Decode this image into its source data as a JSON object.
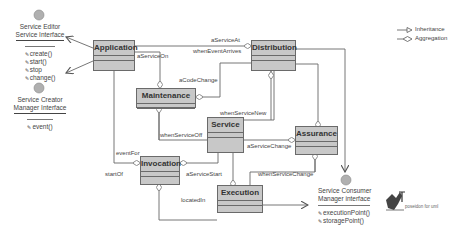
{
  "classes": {
    "application": "Application",
    "distribution": "Distribution",
    "maintenance": "Maintenance",
    "service": "Service",
    "assurance": "Assurance",
    "invocation": "Invocation",
    "execution": "Execution"
  },
  "relations": {
    "aServiceOn": "aServiceOn",
    "aServiceAt": "aServiceAt",
    "whenEventArrives": "whenEventArrives",
    "aCodeChange": "aCodeChange",
    "whenServiceNew": "whenServiceNew",
    "whenServiceOff": "whenServiceOff",
    "aServiceChange": "aServiceChange",
    "eventFor": "eventFor",
    "startOf": "startOf",
    "aServiceStart": "aServiceStart",
    "whenServiceChange": "whenServiceChange",
    "locatedIn": "locatedIn"
  },
  "interfaces": {
    "editor": {
      "name_line1": "Service Editor",
      "name_line2": "Service Interface",
      "ops": [
        "create()",
        "start()",
        "stop",
        "change()"
      ]
    },
    "creator": {
      "name_line1": "Service Creator",
      "name_line2": "Manager Interface",
      "ops": [
        "event()"
      ]
    },
    "consumer": {
      "name_line1": "Service Consumer",
      "name_line2": "Manager interface",
      "ops": [
        "executionPoint()",
        "storagePoint()"
      ]
    }
  },
  "legend": {
    "inheritance": "Inheritance",
    "aggregation": "Aggregation"
  },
  "logo": {
    "caption": "poseidon for uml"
  },
  "colors": {
    "class_fill": "#c8c8c8",
    "line": "#555555",
    "interface_ball": "#b0b0b0"
  }
}
